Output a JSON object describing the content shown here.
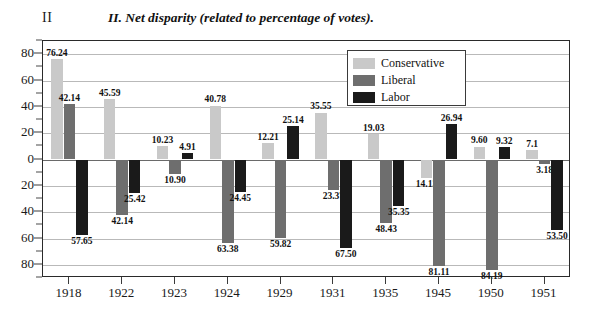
{
  "figure": {
    "marker": "II",
    "title": "II. Net disparity (related to percentage of votes)."
  },
  "legend": {
    "position": "top-right-inside",
    "entries": [
      {
        "label": "Conservative",
        "color": "#c9c9c9"
      },
      {
        "label": "Liberal",
        "color": "#6e6e6e"
      },
      {
        "label": "Labor",
        "color": "#1a1a1a"
      }
    ]
  },
  "chart_data": {
    "type": "bar",
    "title": "II. Net disparity (related to percentage of votes).",
    "xlabel": "",
    "ylabel": "",
    "grid": true,
    "ylim": [
      -90,
      90
    ],
    "yticks": [
      80,
      60,
      40,
      20,
      0,
      -20,
      -40,
      -60,
      -80
    ],
    "ytick_labels": [
      "80",
      "60",
      "40",
      "20",
      "0",
      "20",
      "40",
      "60",
      "80"
    ],
    "categories": [
      "1918",
      "1922",
      "1923",
      "1924",
      "1929",
      "1931",
      "1935",
      "1945",
      "1950",
      "1951"
    ],
    "series": [
      {
        "name": "Conservative",
        "color": "#c9c9c9",
        "values": [
          76.24,
          45.59,
          10.23,
          40.78,
          12.21,
          35.55,
          19.03,
          -14.13,
          9.6,
          7.1
        ],
        "labels": [
          "76.24",
          "45.59",
          "10.23",
          "40.78",
          "12.21",
          "35.55",
          "19.03",
          "14.13",
          "9.60",
          "7.1"
        ]
      },
      {
        "name": "Liberal",
        "color": "#6e6e6e",
        "values": [
          42.14,
          -42.14,
          -10.9,
          -63.38,
          -59.82,
          -23.37,
          -48.43,
          -81.11,
          -84.19,
          -3.18
        ],
        "labels": [
          "42.14",
          "42.14",
          "10.90",
          "63.38",
          "59.82",
          "23.37",
          "48.43",
          "81.11",
          "84.19",
          "3.18"
        ]
      },
      {
        "name": "Labor",
        "color": "#1a1a1a",
        "values": [
          -57.65,
          -25.42,
          4.91,
          -24.45,
          25.14,
          -67.5,
          -35.35,
          26.94,
          9.32,
          -53.5
        ],
        "labels": [
          "57.65",
          "25.42",
          "4.91",
          "24.45",
          "25.14",
          "67.50",
          "35.35",
          "26.94",
          "9.32",
          "53.50"
        ]
      }
    ]
  }
}
